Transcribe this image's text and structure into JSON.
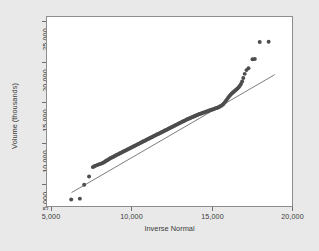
{
  "chart_data": {
    "type": "scatter",
    "title": "",
    "subtitle": "",
    "xlabel": "Inverse Normal",
    "ylabel": "Volume (thousands)",
    "xlim": [
      3800,
      20800
    ],
    "ylim": [
      3600,
      26200
    ],
    "xticks": [
      5000,
      10000,
      15000,
      20000
    ],
    "xtick_labels": [
      "5,000",
      "10,000",
      "15,000",
      "20,000"
    ],
    "yticks": [
      5000,
      10000,
      15000,
      20000,
      25000
    ],
    "ytick_labels": [
      "5,000",
      "10,000",
      "15,000",
      "20,000",
      "25,000"
    ],
    "grid": false,
    "legend": "none",
    "marker_color": "#4d4d4d",
    "line_color": "#5a5a5a",
    "plot_background": "#ffffff",
    "figure_background": "#e9e9e9",
    "reference_line": {
      "label": "45-degree reference line",
      "x": [
        5500,
        19600
      ],
      "y": [
        5200,
        19300
      ]
    },
    "series": [
      {
        "name": "Volume quantiles",
        "points": [
          [
            5480,
            4380
          ],
          [
            6080,
            4480
          ],
          [
            6380,
            6150
          ],
          [
            6720,
            7120
          ],
          [
            6980,
            8250
          ],
          [
            7060,
            8320
          ],
          [
            7140,
            8400
          ],
          [
            7230,
            8460
          ],
          [
            7320,
            8520
          ],
          [
            7420,
            8580
          ],
          [
            7520,
            8640
          ],
          [
            7620,
            8700
          ],
          [
            7720,
            8800
          ],
          [
            7820,
            8900
          ],
          [
            7900,
            9000
          ],
          [
            7980,
            9080
          ],
          [
            8060,
            9160
          ],
          [
            8140,
            9240
          ],
          [
            8220,
            9330
          ],
          [
            8300,
            9400
          ],
          [
            8380,
            9470
          ],
          [
            8460,
            9540
          ],
          [
            8540,
            9610
          ],
          [
            8620,
            9690
          ],
          [
            8700,
            9760
          ],
          [
            8780,
            9830
          ],
          [
            8860,
            9900
          ],
          [
            8940,
            9970
          ],
          [
            9020,
            10040
          ],
          [
            9100,
            10110
          ],
          [
            9180,
            10180
          ],
          [
            9260,
            10250
          ],
          [
            9340,
            10320
          ],
          [
            9420,
            10390
          ],
          [
            9500,
            10460
          ],
          [
            9580,
            10530
          ],
          [
            9660,
            10600
          ],
          [
            9740,
            10670
          ],
          [
            9820,
            10740
          ],
          [
            9900,
            10810
          ],
          [
            9980,
            10880
          ],
          [
            10060,
            10950
          ],
          [
            10140,
            11020
          ],
          [
            10220,
            11090
          ],
          [
            10300,
            11160
          ],
          [
            10380,
            11230
          ],
          [
            10460,
            11300
          ],
          [
            10540,
            11370
          ],
          [
            10620,
            11440
          ],
          [
            10700,
            11510
          ],
          [
            10780,
            11580
          ],
          [
            10860,
            11650
          ],
          [
            10940,
            11720
          ],
          [
            11020,
            11790
          ],
          [
            11100,
            11860
          ],
          [
            11180,
            11930
          ],
          [
            11260,
            12000
          ],
          [
            11340,
            12070
          ],
          [
            11420,
            12140
          ],
          [
            11500,
            12200
          ],
          [
            11580,
            12270
          ],
          [
            11660,
            12340
          ],
          [
            11740,
            12410
          ],
          [
            11820,
            12480
          ],
          [
            11900,
            12550
          ],
          [
            11980,
            12620
          ],
          [
            12060,
            12690
          ],
          [
            12140,
            12760
          ],
          [
            12220,
            12830
          ],
          [
            12300,
            12900
          ],
          [
            12380,
            12970
          ],
          [
            12460,
            13040
          ],
          [
            12540,
            13110
          ],
          [
            12620,
            13180
          ],
          [
            12700,
            13250
          ],
          [
            12780,
            13320
          ],
          [
            12860,
            13390
          ],
          [
            12940,
            13460
          ],
          [
            13020,
            13530
          ],
          [
            13100,
            13600
          ],
          [
            13180,
            13670
          ],
          [
            13260,
            13730
          ],
          [
            13340,
            13800
          ],
          [
            13420,
            13870
          ],
          [
            13500,
            13940
          ],
          [
            13580,
            14000
          ],
          [
            13660,
            14070
          ],
          [
            13740,
            14130
          ],
          [
            13820,
            14190
          ],
          [
            13900,
            14250
          ],
          [
            13980,
            14310
          ],
          [
            14060,
            14370
          ],
          [
            14140,
            14430
          ],
          [
            14220,
            14480
          ],
          [
            14300,
            14540
          ],
          [
            14380,
            14590
          ],
          [
            14460,
            14640
          ],
          [
            14540,
            14690
          ],
          [
            14620,
            14740
          ],
          [
            14700,
            14790
          ],
          [
            14780,
            14840
          ],
          [
            14860,
            14890
          ],
          [
            14940,
            14940
          ],
          [
            15020,
            14990
          ],
          [
            15100,
            15040
          ],
          [
            15180,
            15080
          ],
          [
            15260,
            15130
          ],
          [
            15340,
            15180
          ],
          [
            15420,
            15230
          ],
          [
            15500,
            15280
          ],
          [
            15580,
            15330
          ],
          [
            15660,
            15390
          ],
          [
            15740,
            15450
          ],
          [
            15820,
            15520
          ],
          [
            15900,
            15600
          ],
          [
            15980,
            15700
          ],
          [
            16060,
            15830
          ],
          [
            16140,
            16000
          ],
          [
            16220,
            16180
          ],
          [
            16300,
            16380
          ],
          [
            16380,
            16580
          ],
          [
            16460,
            16750
          ],
          [
            16540,
            16900
          ],
          [
            16620,
            17040
          ],
          [
            16700,
            17180
          ],
          [
            16780,
            17300
          ],
          [
            16860,
            17420
          ],
          [
            16940,
            17540
          ],
          [
            17020,
            17660
          ],
          [
            17100,
            17800
          ],
          [
            17180,
            17980
          ],
          [
            17260,
            18200
          ],
          [
            17340,
            18500
          ],
          [
            17420,
            18900
          ],
          [
            17520,
            19400
          ],
          [
            17640,
            19850
          ],
          [
            17780,
            20080
          ],
          [
            18060,
            21150
          ],
          [
            18220,
            21180
          ],
          [
            18560,
            23200
          ],
          [
            19180,
            23230
          ]
        ]
      }
    ]
  }
}
